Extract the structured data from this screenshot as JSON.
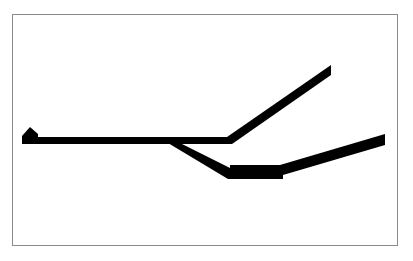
{
  "diagram": {
    "type": "line-schematic",
    "colors": {
      "stroke": "#000000",
      "background": "#ffffff",
      "border": "#8a8a8a"
    },
    "elements": [
      {
        "name": "start-marker",
        "shape": "pentagon",
        "points": [
          [
            22,
            136
          ],
          [
            22,
            143
          ],
          [
            38,
            143
          ],
          [
            38,
            133
          ],
          [
            30,
            127
          ]
        ]
      },
      {
        "name": "main-line",
        "from": [
          22,
          140
        ],
        "to": [
          230,
          140
        ],
        "width": 6
      },
      {
        "name": "upper-branch",
        "from": [
          230,
          140
        ],
        "to": [
          331,
          68
        ],
        "width": 7
      },
      {
        "name": "lower-diagonal",
        "from": [
          172,
          140
        ],
        "to": [
          232,
          175
        ],
        "width": 7
      },
      {
        "name": "thick-segment",
        "from": [
          230,
          172
        ],
        "to": [
          283,
          172
        ],
        "width": 12
      },
      {
        "name": "lower-branch",
        "from": [
          283,
          170
        ],
        "to": [
          385,
          139
        ],
        "width": 10
      }
    ]
  }
}
